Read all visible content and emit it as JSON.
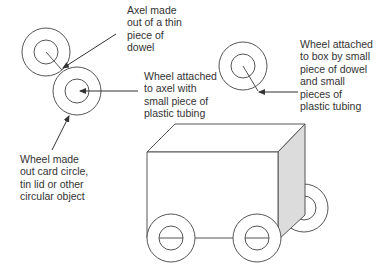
{
  "diagram": {
    "colors": {
      "stroke": "#555555",
      "side_face": "#dcdcdc",
      "text": "#333333"
    },
    "labels": {
      "axel": {
        "lines": [
          "Axel made",
          "out of a thin",
          "piece of",
          "dowel"
        ]
      },
      "wheel_axel": {
        "lines": [
          "Wheel attached",
          "to axel with",
          "small piece of",
          "plastic tubing"
        ]
      },
      "wheel_box": {
        "lines": [
          "Wheel attached",
          "to box by small",
          "piece of dowel",
          "and small",
          "pieces of",
          "plastic tubing"
        ]
      },
      "wheel_made": {
        "lines": [
          "Wheel made",
          "out card circle,",
          "tin lid or other",
          "circular object"
        ]
      }
    }
  }
}
